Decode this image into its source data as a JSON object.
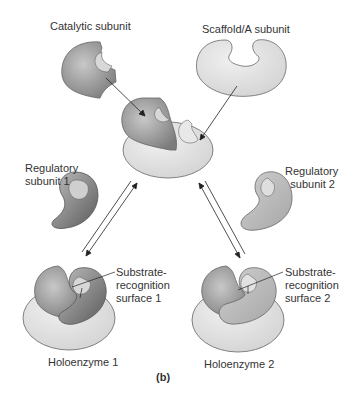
{
  "labels": {
    "catalytic": "Catalytic subunit",
    "scaffold": "Scaffold/A subunit",
    "reg1_line1": "Regulatory",
    "reg1_line2": "subunit 1",
    "reg2_line1": "Regulatory",
    "reg2_line2": "subunit 2",
    "sub1_line1": "Substrate-",
    "sub1_line2": "recognition",
    "sub1_line3": "surface 1",
    "sub2_line1": "Substrate-",
    "sub2_line2": "recognition",
    "sub2_line3": "surface 2",
    "holo1": "Holoenzyme 1",
    "holo2": "Holoenzyme 2",
    "panel": "(b)"
  },
  "colors": {
    "catalytic": "#9a9a9a",
    "scaffold": "#e4e4e4",
    "regulatory1": "#7a7a7a",
    "regulatory2": "#b8b8b8",
    "outline": "#555555"
  }
}
